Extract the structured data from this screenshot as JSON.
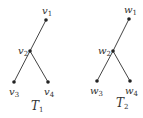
{
  "trees": [
    {
      "label": "T",
      "label_sub": "1",
      "nodes": [
        {
          "id": "v1",
          "name": "v",
          "sub": "1",
          "x": 46,
          "y": 20
        },
        {
          "id": "v2",
          "name": "v",
          "sub": "2",
          "x": 30,
          "y": 51
        },
        {
          "id": "v3",
          "name": "v",
          "sub": "3",
          "x": 14,
          "y": 82
        },
        {
          "id": "v4",
          "name": "v",
          "sub": "4",
          "x": 48,
          "y": 82
        }
      ]
    },
    {
      "label": "T",
      "label_sub": "2",
      "nodes": [
        {
          "id": "w1",
          "name": "w",
          "sub": "1",
          "x": 129,
          "y": 19
        },
        {
          "id": "w2",
          "name": "w",
          "sub": "2",
          "x": 113,
          "y": 51
        },
        {
          "id": "w3",
          "name": "w",
          "sub": "3",
          "x": 97,
          "y": 81
        },
        {
          "id": "w4",
          "name": "w",
          "sub": "4",
          "x": 130,
          "y": 81
        }
      ]
    }
  ],
  "colors": {
    "edge": "#444444",
    "node": "#222222",
    "text": "#333333"
  }
}
